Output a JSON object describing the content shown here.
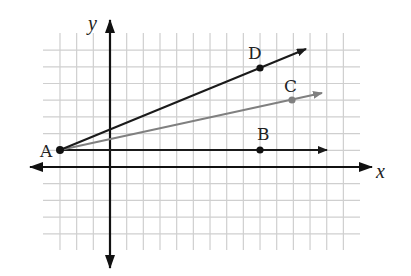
{
  "diagram": {
    "type": "coordinate-plane-rays",
    "axes": {
      "x_label": "x",
      "y_label": "y"
    },
    "grid": {
      "x_min": -4,
      "x_max": 14,
      "y_min": -5,
      "y_max": 7,
      "step": 1
    },
    "colors": {
      "grid": "#cfcfcf",
      "axis": "#111111",
      "ray_dark": "#1a1a1a",
      "ray_gray": "#808080"
    },
    "points": [
      {
        "label": "A",
        "x": -3,
        "y": 1
      },
      {
        "label": "B",
        "x": 9,
        "y": 1
      },
      {
        "label": "C",
        "x": 11,
        "y": 4
      },
      {
        "label": "D",
        "x": 9,
        "y": 6
      }
    ],
    "rays": [
      {
        "name": "AB",
        "from": "A",
        "through": "B",
        "color": "dark"
      },
      {
        "name": "AC",
        "from": "A",
        "through": "C",
        "color": "gray"
      },
      {
        "name": "AD",
        "from": "A",
        "through": "D",
        "color": "dark"
      }
    ]
  }
}
